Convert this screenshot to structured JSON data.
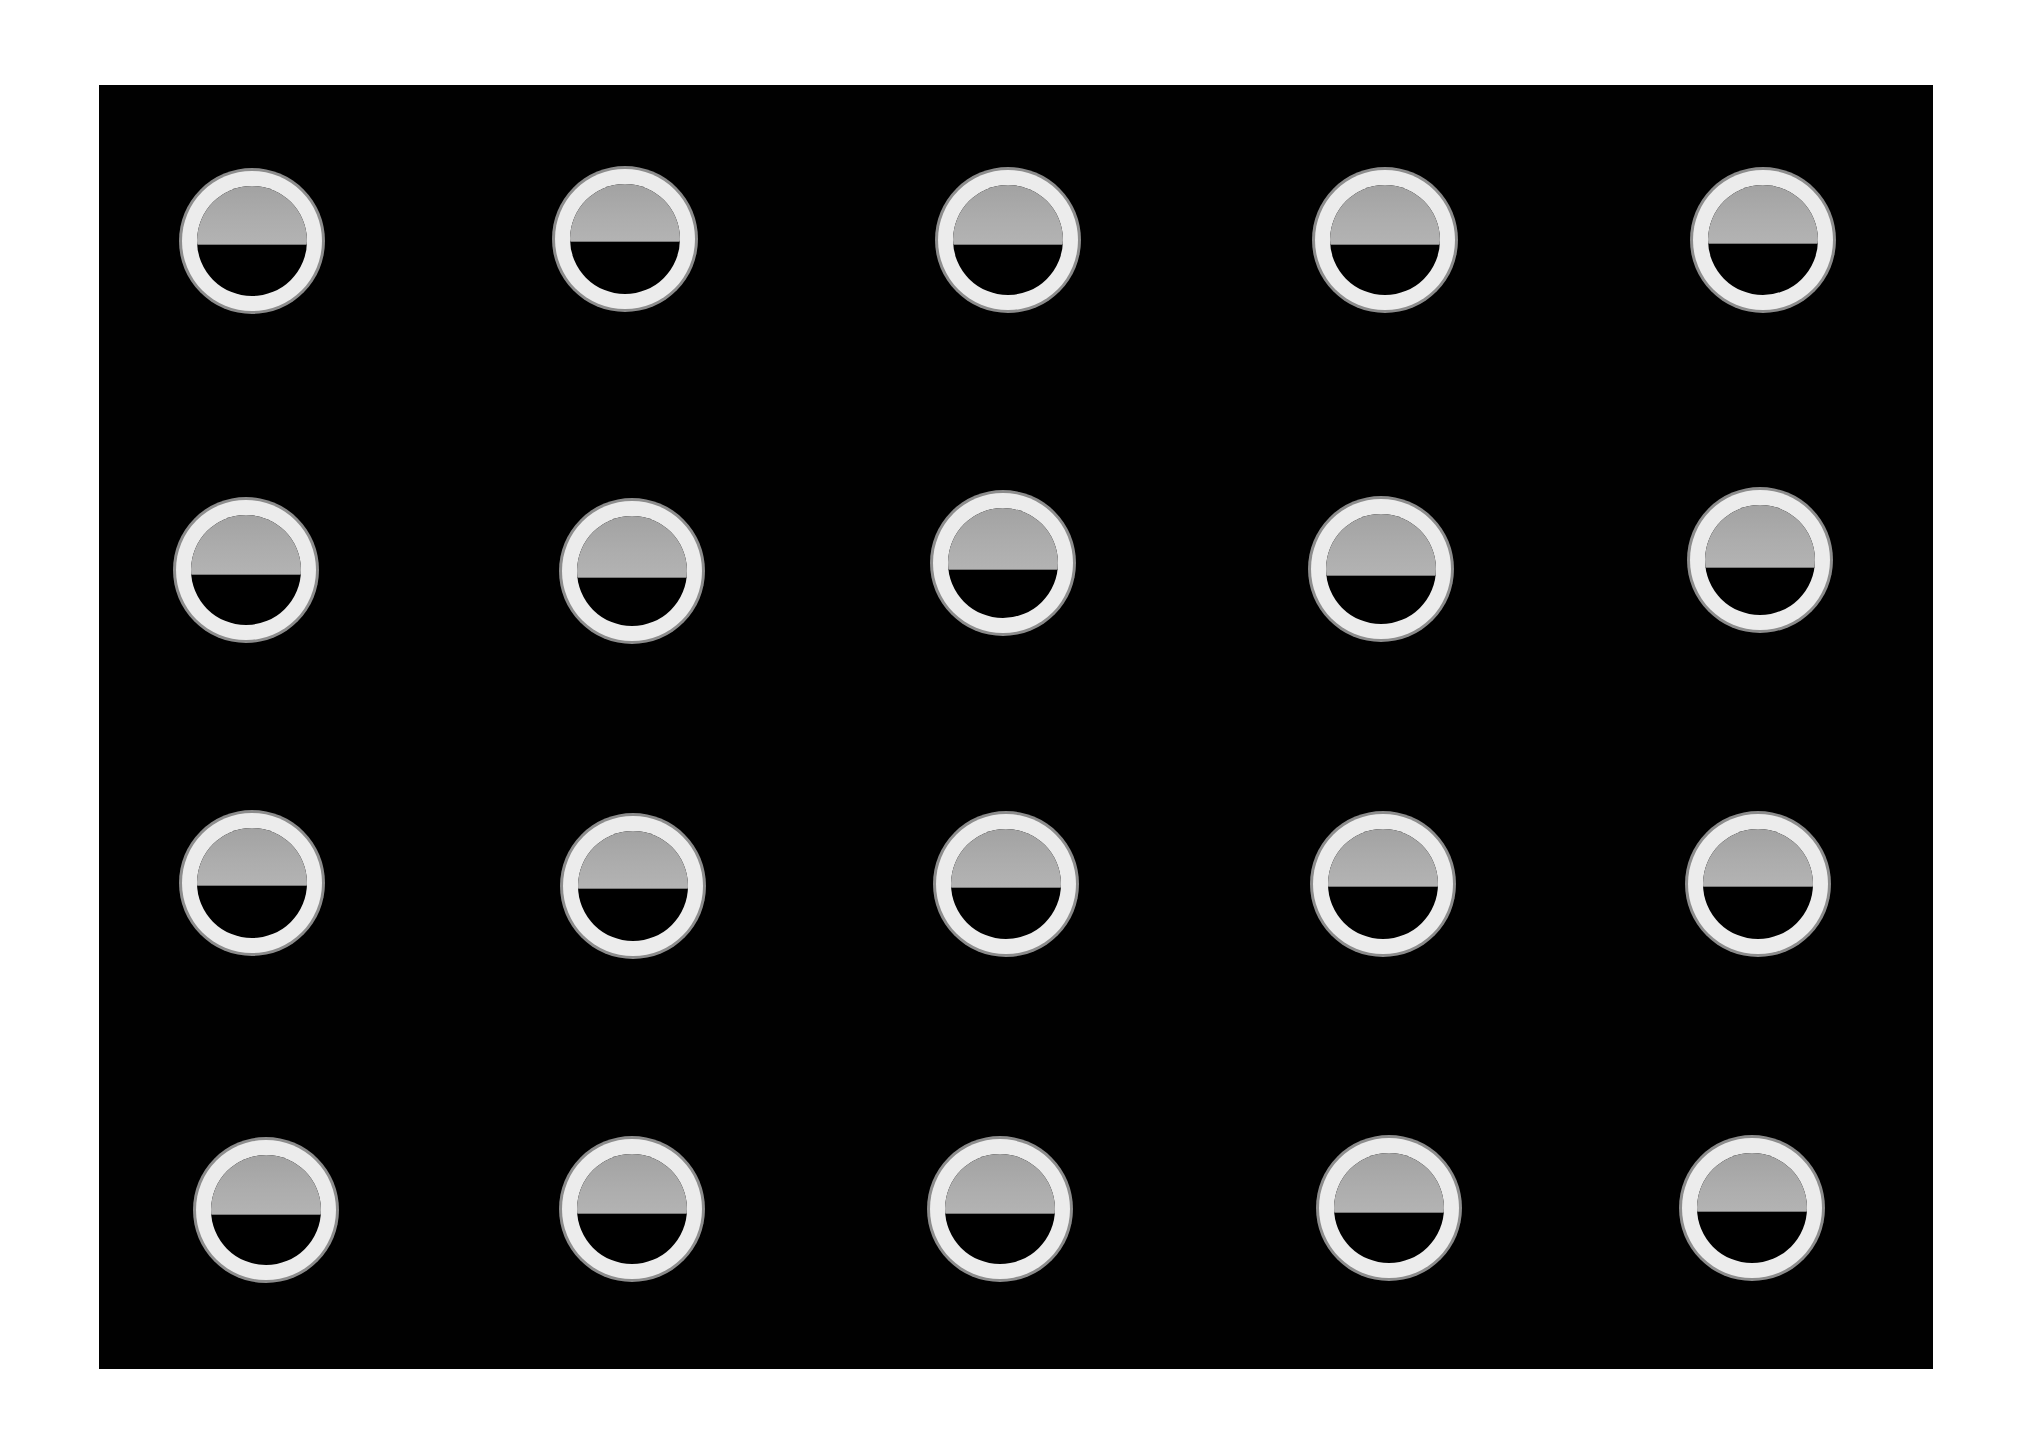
{
  "scene": {
    "description": "Grid of 20 translucent circular wells (ring with half-filled gray interior) on a black background",
    "background_color": "#ffffff",
    "panel_color": "#010101",
    "ring_color": "#ececec",
    "halo_color": "#8c8c8c",
    "fill_color": "#aaaaaa",
    "rows": 4,
    "cols": 5
  },
  "discs": [
    {
      "row": 1,
      "col": 1,
      "cx": 252,
      "cy": 241,
      "fill_pct": 53
    },
    {
      "row": 1,
      "col": 2,
      "cx": 625,
      "cy": 239,
      "fill_pct": 52
    },
    {
      "row": 1,
      "col": 3,
      "cx": 1008,
      "cy": 240,
      "fill_pct": 54
    },
    {
      "row": 1,
      "col": 4,
      "cx": 1385,
      "cy": 240,
      "fill_pct": 54
    },
    {
      "row": 1,
      "col": 5,
      "cx": 1763,
      "cy": 240,
      "fill_pct": 53
    },
    {
      "row": 2,
      "col": 1,
      "cx": 246,
      "cy": 570,
      "fill_pct": 54
    },
    {
      "row": 2,
      "col": 2,
      "cx": 632,
      "cy": 571,
      "fill_pct": 55
    },
    {
      "row": 2,
      "col": 3,
      "cx": 1003,
      "cy": 563,
      "fill_pct": 55
    },
    {
      "row": 2,
      "col": 4,
      "cx": 1381,
      "cy": 569,
      "fill_pct": 55
    },
    {
      "row": 2,
      "col": 5,
      "cx": 1760,
      "cy": 560,
      "fill_pct": 56
    },
    {
      "row": 3,
      "col": 1,
      "cx": 252,
      "cy": 883,
      "fill_pct": 52
    },
    {
      "row": 3,
      "col": 2,
      "cx": 633,
      "cy": 886,
      "fill_pct": 52
    },
    {
      "row": 3,
      "col": 3,
      "cx": 1006,
      "cy": 884,
      "fill_pct": 53
    },
    {
      "row": 3,
      "col": 4,
      "cx": 1383,
      "cy": 884,
      "fill_pct": 52
    },
    {
      "row": 3,
      "col": 5,
      "cx": 1758,
      "cy": 884,
      "fill_pct": 52
    },
    {
      "row": 4,
      "col": 1,
      "cx": 266,
      "cy": 1210,
      "fill_pct": 54
    },
    {
      "row": 4,
      "col": 2,
      "cx": 632,
      "cy": 1209,
      "fill_pct": 54
    },
    {
      "row": 4,
      "col": 3,
      "cx": 1000,
      "cy": 1209,
      "fill_pct": 54
    },
    {
      "row": 4,
      "col": 4,
      "cx": 1389,
      "cy": 1208,
      "fill_pct": 54
    },
    {
      "row": 4,
      "col": 5,
      "cx": 1752,
      "cy": 1208,
      "fill_pct": 53
    }
  ]
}
